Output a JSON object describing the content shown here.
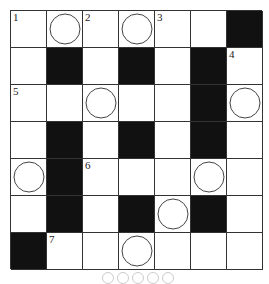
{
  "puzzle": {
    "rows": 7,
    "cols": 7,
    "grid": [
      [
        "W",
        "C",
        "W",
        "C",
        "W",
        "W",
        "B"
      ],
      [
        "W",
        "B",
        "W",
        "B",
        "W",
        "B",
        "W"
      ],
      [
        "W",
        "W",
        "C",
        "W",
        "W",
        "B",
        "C"
      ],
      [
        "W",
        "B",
        "W",
        "B",
        "W",
        "B",
        "W"
      ],
      [
        "C",
        "B",
        "W",
        "W",
        "W",
        "C",
        "W"
      ],
      [
        "W",
        "B",
        "W",
        "B",
        "C",
        "B",
        "W"
      ],
      [
        "B",
        "W",
        "W",
        "C",
        "W",
        "W",
        "W"
      ]
    ],
    "numbers": [
      {
        "row": 0,
        "col": 0,
        "label": "1"
      },
      {
        "row": 0,
        "col": 2,
        "label": "2"
      },
      {
        "row": 0,
        "col": 4,
        "label": "3"
      },
      {
        "row": 1,
        "col": 6,
        "label": "4"
      },
      {
        "row": 2,
        "col": 0,
        "label": "5"
      },
      {
        "row": 4,
        "col": 2,
        "label": "6"
      },
      {
        "row": 6,
        "col": 1,
        "label": "7"
      }
    ],
    "legend": {
      "W": "white-cell",
      "B": "black-cell",
      "C": "circled-cell"
    },
    "answer_blanks": 5
  }
}
